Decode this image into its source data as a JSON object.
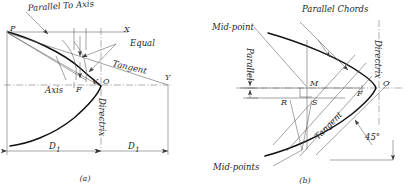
{
  "figure": {
    "panels": [
      {
        "id": "a",
        "caption": "(a)",
        "annotations": {
          "parallel_to_axis": "Parallel To Axis",
          "equal": "Equal",
          "tangent": "Tangent",
          "axis": "Axis",
          "directrix": "Directrix"
        },
        "points": {
          "p": "P",
          "x": "X",
          "y": "Y",
          "v": "V",
          "o": "O",
          "f": "F"
        },
        "dimensions": {
          "left": "D",
          "left_sub": "1",
          "right": "D",
          "right_sub": "1"
        }
      },
      {
        "id": "b",
        "caption": "(b)",
        "annotations": {
          "parallel_chords": "Parallel Chords",
          "mid_point": "Mid-point",
          "mid_points": "Mid-points",
          "parallel": "Parallel",
          "directrix": "Directrix",
          "tangent": "Tangent",
          "angle": "45°"
        },
        "points": {
          "m": "M",
          "r": "R",
          "s": "S",
          "f": "F",
          "o": "O"
        }
      }
    ]
  },
  "colors": {
    "curve": "#111111",
    "thin_line": "#4a4a4a",
    "center_line": "#5c5c5c",
    "text": "#262626",
    "background": "#ffffff"
  }
}
